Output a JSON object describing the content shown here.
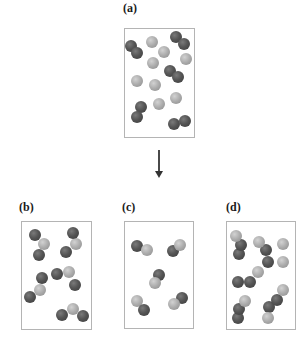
{
  "labels": {
    "a": "(a)",
    "b": "(b)",
    "c": "(c)",
    "d": "(d)"
  },
  "colors": {
    "dark_atom": "#555555",
    "light_atom": "#ababab",
    "box_border": "#b4b4b4",
    "arrow": "#4a4a4a"
  },
  "panels": [
    {
      "id": "a",
      "box": {
        "x": 124,
        "y": 28,
        "w": 71,
        "h": 110
      },
      "atoms": [
        {
          "type": "dark",
          "x": 131,
          "y": 46
        },
        {
          "type": "dark",
          "x": 137,
          "y": 53
        },
        {
          "type": "light",
          "x": 152,
          "y": 42
        },
        {
          "type": "dark",
          "x": 176,
          "y": 37
        },
        {
          "type": "dark",
          "x": 184,
          "y": 44
        },
        {
          "type": "light",
          "x": 164,
          "y": 52
        },
        {
          "type": "light",
          "x": 153,
          "y": 63
        },
        {
          "type": "light",
          "x": 186,
          "y": 59
        },
        {
          "type": "dark",
          "x": 170,
          "y": 71
        },
        {
          "type": "dark",
          "x": 178,
          "y": 77
        },
        {
          "type": "light",
          "x": 137,
          "y": 81
        },
        {
          "type": "light",
          "x": 155,
          "y": 85
        },
        {
          "type": "light",
          "x": 176,
          "y": 98
        },
        {
          "type": "light",
          "x": 159,
          "y": 104
        },
        {
          "type": "dark",
          "x": 141,
          "y": 107
        },
        {
          "type": "dark",
          "x": 137,
          "y": 117
        },
        {
          "type": "dark",
          "x": 174,
          "y": 124
        },
        {
          "type": "dark",
          "x": 185,
          "y": 121
        }
      ]
    },
    {
      "id": "b",
      "box": {
        "x": 21,
        "y": 221,
        "w": 71,
        "h": 109
      },
      "atoms": [
        {
          "type": "light",
          "x": 44,
          "y": 244
        },
        {
          "type": "dark",
          "x": 35,
          "y": 235
        },
        {
          "type": "dark",
          "x": 39,
          "y": 255
        },
        {
          "type": "light",
          "x": 76,
          "y": 244
        },
        {
          "type": "dark",
          "x": 73,
          "y": 233
        },
        {
          "type": "dark",
          "x": 66,
          "y": 252
        },
        {
          "type": "light",
          "x": 69,
          "y": 272
        },
        {
          "type": "dark",
          "x": 57,
          "y": 274
        },
        {
          "type": "dark",
          "x": 75,
          "y": 285
        },
        {
          "type": "light",
          "x": 40,
          "y": 290
        },
        {
          "type": "dark",
          "x": 42,
          "y": 278
        },
        {
          "type": "dark",
          "x": 30,
          "y": 297
        },
        {
          "type": "light",
          "x": 73,
          "y": 309
        },
        {
          "type": "dark",
          "x": 62,
          "y": 315
        },
        {
          "type": "dark",
          "x": 83,
          "y": 316
        }
      ]
    },
    {
      "id": "c",
      "box": {
        "x": 124,
        "y": 221,
        "w": 70,
        "h": 108
      },
      "atoms": [
        {
          "type": "dark",
          "x": 137,
          "y": 246
        },
        {
          "type": "light",
          "x": 147,
          "y": 250
        },
        {
          "type": "dark",
          "x": 173,
          "y": 251
        },
        {
          "type": "light",
          "x": 180,
          "y": 245
        },
        {
          "type": "dark",
          "x": 159,
          "y": 275
        },
        {
          "type": "light",
          "x": 155,
          "y": 283
        },
        {
          "type": "light",
          "x": 137,
          "y": 301
        },
        {
          "type": "dark",
          "x": 144,
          "y": 310
        },
        {
          "type": "dark",
          "x": 182,
          "y": 298
        },
        {
          "type": "light",
          "x": 174,
          "y": 304
        }
      ]
    },
    {
      "id": "d",
      "box": {
        "x": 226,
        "y": 221,
        "w": 70,
        "h": 109
      },
      "atoms": [
        {
          "type": "dark",
          "x": 239,
          "y": 254
        },
        {
          "type": "dark",
          "x": 241,
          "y": 245
        },
        {
          "type": "light",
          "x": 236,
          "y": 236
        },
        {
          "type": "dark",
          "x": 268,
          "y": 262
        },
        {
          "type": "dark",
          "x": 266,
          "y": 250
        },
        {
          "type": "light",
          "x": 259,
          "y": 242
        },
        {
          "type": "light",
          "x": 283,
          "y": 244
        },
        {
          "type": "light",
          "x": 283,
          "y": 262
        },
        {
          "type": "dark",
          "x": 238,
          "y": 282
        },
        {
          "type": "dark",
          "x": 250,
          "y": 282
        },
        {
          "type": "light",
          "x": 258,
          "y": 272
        },
        {
          "type": "dark",
          "x": 269,
          "y": 307
        },
        {
          "type": "dark",
          "x": 277,
          "y": 300
        },
        {
          "type": "light",
          "x": 283,
          "y": 290
        },
        {
          "type": "dark",
          "x": 238,
          "y": 318
        },
        {
          "type": "dark",
          "x": 239,
          "y": 309
        },
        {
          "type": "light",
          "x": 245,
          "y": 301
        },
        {
          "type": "light",
          "x": 268,
          "y": 318
        }
      ]
    }
  ]
}
